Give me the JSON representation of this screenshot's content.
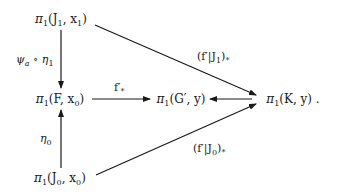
{
  "diagram": {
    "type": "commutative-diagram",
    "nodes": {
      "pi_J1": {
        "symbol": "π",
        "sub": "1",
        "args": "(J",
        "args_sub": "1",
        "args_rest": ", x",
        "args_rest_sub": "1",
        "close": ")"
      },
      "pi_F": {
        "symbol": "π",
        "sub": "1",
        "args": "(F, x",
        "args_sub": "0",
        "close": ")"
      },
      "pi_J0": {
        "symbol": "π",
        "sub": "1",
        "args": "(J",
        "args_sub": "0",
        "args_rest": ", x",
        "args_rest_sub": "0",
        "close": ")"
      },
      "pi_G": {
        "symbol": "π",
        "sub": "1",
        "args": "(G′, y)"
      },
      "pi_K": {
        "symbol": "π",
        "sub": "1",
        "args": "(K, y)",
        "trailing": " ."
      }
    },
    "arrows": {
      "J1_to_F": {
        "label_a": "ψ",
        "label_a_sub": "a",
        "label_op": " ∘ ",
        "label_b": "η",
        "label_b_sub": "1"
      },
      "J0_to_F": {
        "label": "η",
        "label_sub": "0"
      },
      "F_to_G": {
        "label": "f′",
        "label_sub": "*"
      },
      "J1_to_K": {
        "label_open": "(f′|J",
        "label_sub": "1",
        "label_close": ")",
        "label_close_sub": "*"
      },
      "J0_to_K": {
        "label_open": "(f′|J",
        "label_sub": "0",
        "label_close": ")",
        "label_close_sub": "*"
      },
      "K_to_G": {
        "label": ""
      }
    },
    "stroke_color": "#1a1a1a"
  }
}
